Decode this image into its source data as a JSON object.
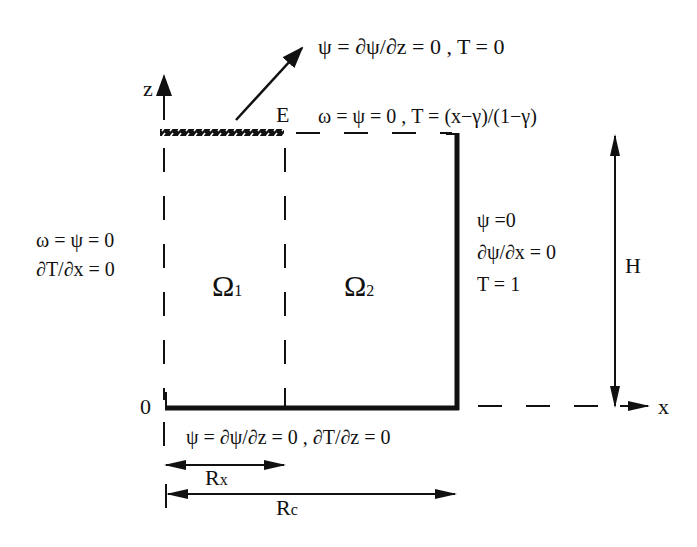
{
  "diagram": {
    "axes": {
      "z_label": "z",
      "x_label": "x",
      "origin_label": "0"
    },
    "regions": [
      {
        "symbol": "Ω",
        "subscript": "1"
      },
      {
        "symbol": "Ω",
        "subscript": "2"
      }
    ],
    "point_label": "E",
    "boundary_conditions": {
      "exit_arrow": "ψ = ∂ψ/∂z = 0 , T = 0",
      "top": "ω = ψ = 0 , T = (x−γ)/(1−γ)",
      "left_line1": "ω = ψ = 0",
      "left_line2": "∂T/∂x = 0",
      "right_line1": "ψ =0",
      "right_line2": "∂ψ/∂x = 0",
      "right_line3": "T = 1",
      "bottom": "ψ = ∂ψ/∂z = 0 , ∂T/∂z = 0"
    },
    "dimensions": {
      "height_label": "H",
      "rx_label": "R",
      "rx_sub": "x",
      "rc_label": "R",
      "rc_sub": "c"
    },
    "colors": {
      "ink": "#111111",
      "background": "#ffffff"
    }
  }
}
